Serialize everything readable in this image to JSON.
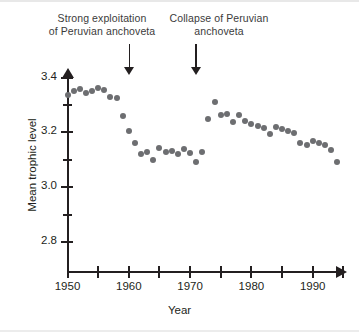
{
  "chart_data": {
    "type": "scatter",
    "title": "",
    "xlabel": "Year",
    "ylabel": "Mean trophic level",
    "xlim": [
      1948,
      1996
    ],
    "ylim": [
      2.72,
      3.42
    ],
    "grid": false,
    "legend": null,
    "x_ticks": [
      1950,
      1955,
      1960,
      1965,
      1970,
      1975,
      1980,
      1985,
      1990,
      1995
    ],
    "x_tick_labels": [
      "1950",
      "",
      "1960",
      "",
      "1970",
      "",
      "1980",
      "",
      "1990",
      ""
    ],
    "y_ticks": [
      2.8,
      2.9,
      3.0,
      3.1,
      3.2,
      3.3,
      3.4
    ],
    "y_tick_labels": [
      "2.8",
      "",
      "3.0",
      "",
      "3.2",
      "",
      "3.4"
    ],
    "point_color": "#6d6e71",
    "axis_color": "#231f20",
    "series": [
      {
        "name": "Mean trophic level",
        "x": [
          1950,
          1951,
          1952,
          1953,
          1954,
          1955,
          1956,
          1957,
          1958,
          1959,
          1960,
          1961,
          1962,
          1963,
          1964,
          1965,
          1966,
          1967,
          1968,
          1969,
          1970,
          1971,
          1972,
          1973,
          1974,
          1975,
          1976,
          1977,
          1978,
          1979,
          1980,
          1981,
          1982,
          1983,
          1984,
          1985,
          1986,
          1987,
          1988,
          1989,
          1990,
          1991,
          1992,
          1993,
          1994
        ],
        "values": [
          3.335,
          3.35,
          3.357,
          3.345,
          3.352,
          3.36,
          3.356,
          3.33,
          3.325,
          3.26,
          3.205,
          3.16,
          3.12,
          3.128,
          3.098,
          3.142,
          3.128,
          3.132,
          3.12,
          3.14,
          3.125,
          3.09,
          3.128,
          3.25,
          3.31,
          3.265,
          3.267,
          3.238,
          3.262,
          3.24,
          3.232,
          3.222,
          3.215,
          3.193,
          3.221,
          3.213,
          3.205,
          3.196,
          3.16,
          3.152,
          3.17,
          3.16,
          3.155,
          3.135,
          3.09
        ]
      }
    ],
    "annotations": [
      {
        "text": "Strong exploitation\nof Peruvian anchoveta",
        "arrow_year": 1960
      },
      {
        "text": "Collapse of Peruvian\nanchoveta",
        "arrow_year": 1970.8
      }
    ]
  }
}
